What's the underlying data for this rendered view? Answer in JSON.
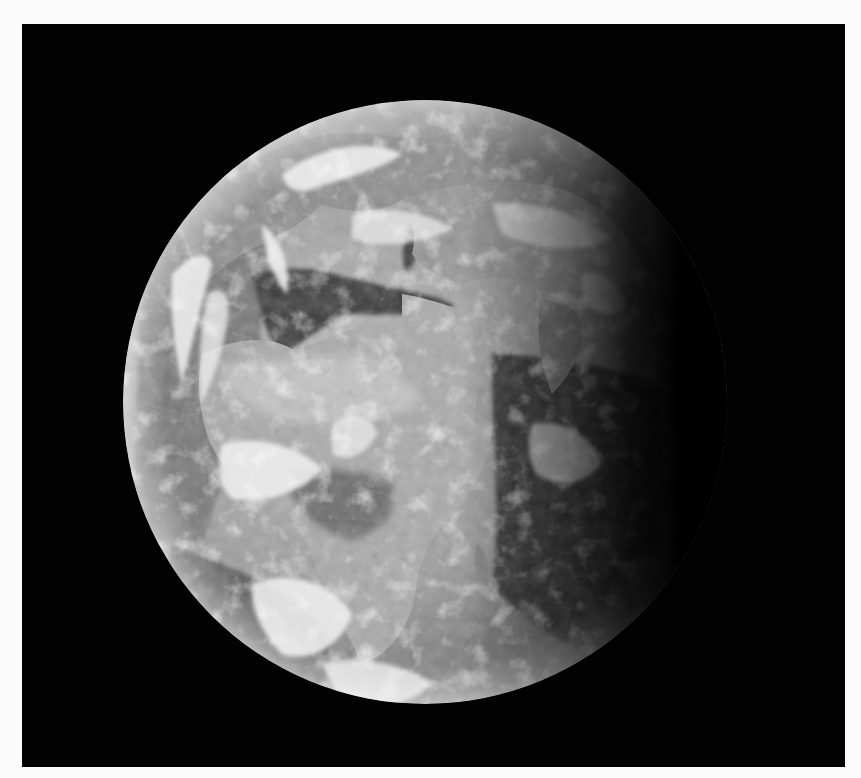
{
  "image": {
    "alt": "Black-and-white photograph of Earth from space showing Africa, the Mediterranean, the Arabian Peninsula and Europe, with a dark terminator on the right side",
    "subject": "earth-globe",
    "background_color": "#020202",
    "border_color": "#fbfbfb",
    "globe": {
      "center_x": 403,
      "center_y": 378,
      "radius": 302
    }
  }
}
